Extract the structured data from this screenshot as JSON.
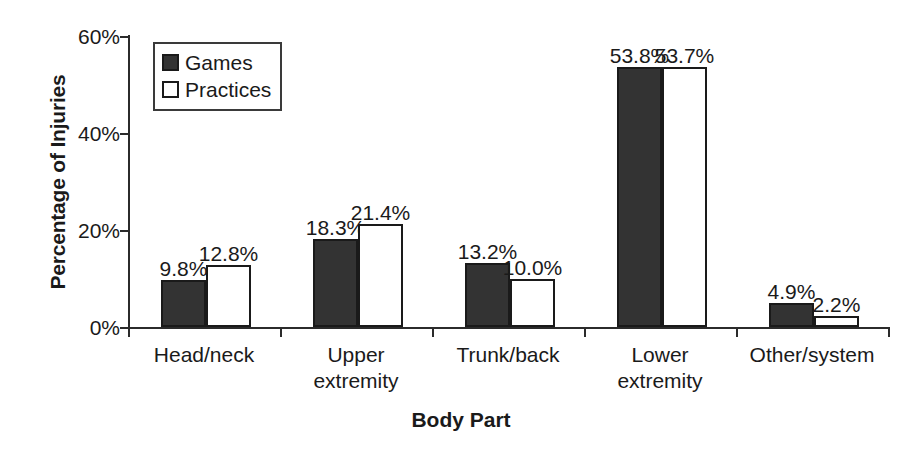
{
  "chart_data": {
    "type": "bar",
    "title": "",
    "xlabel": "Body Part",
    "ylabel": "Percentage of Injuries",
    "categories": [
      "Head/neck",
      "Upper\nextremity",
      "Trunk/back",
      "Lower\nextremity",
      "Other/system"
    ],
    "series": [
      {
        "name": "Games",
        "color": "#333333",
        "values": [
          9.8,
          18.3,
          13.2,
          53.8,
          4.9
        ],
        "labels": [
          "9.8%",
          "18.3%",
          "13.2%",
          "53.8%",
          "4.9%"
        ]
      },
      {
        "name": "Practices",
        "color": "#ffffff",
        "values": [
          12.8,
          21.4,
          10.0,
          53.7,
          2.2
        ],
        "labels": [
          "12.8%",
          "21.4%",
          "10.0%",
          "53.7%",
          "2.2%"
        ]
      }
    ],
    "ylim": [
      0,
      60
    ],
    "yticks": [
      0,
      20,
      40,
      60
    ],
    "ytick_labels": [
      "0%",
      "20%",
      "40%",
      "60%"
    ],
    "grid": false,
    "legend_position": "top-left",
    "legend": [
      "Games",
      "Practices"
    ],
    "axis_color": "#2b2b2b",
    "bar_outline_color": "#1a1a1a"
  }
}
